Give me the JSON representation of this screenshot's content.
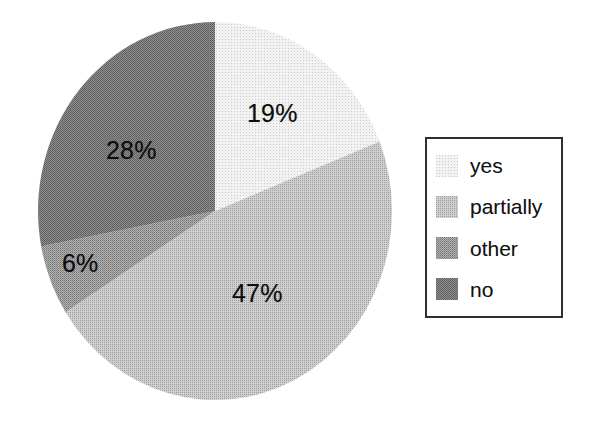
{
  "chart_data": {
    "type": "pie",
    "title": "",
    "subtitle": "",
    "xlabel": "",
    "ylabel": "",
    "grid": false,
    "legend_position": "right",
    "start_angle_deg": 0,
    "direction": "clockwise",
    "categories": [
      "yes",
      "partially",
      "other",
      "no"
    ],
    "values": [
      19,
      47,
      6,
      28
    ],
    "value_labels": [
      "19%",
      "47%",
      "6%",
      "28%"
    ],
    "colors": [
      "#e9e9e9",
      "#bdbdbd",
      "#9b9b9b",
      "#7b7b7b"
    ],
    "slices": [
      {
        "label": "yes",
        "value": 19,
        "value_label": "19%",
        "color": "#e9e9e9"
      },
      {
        "label": "partially",
        "value": 47,
        "value_label": "47%",
        "color": "#bdbdbd"
      },
      {
        "label": "other",
        "value": 6,
        "value_label": "6%",
        "color": "#9b9b9b"
      },
      {
        "label": "no",
        "value": 28,
        "value_label": "28%",
        "color": "#7b7b7b"
      }
    ]
  },
  "legend": {
    "items": [
      {
        "label": "yes",
        "color": "#e9e9e9"
      },
      {
        "label": "partially",
        "color": "#bdbdbd"
      },
      {
        "label": "other",
        "color": "#9b9b9b"
      },
      {
        "label": "no",
        "color": "#7b7b7b"
      }
    ]
  }
}
